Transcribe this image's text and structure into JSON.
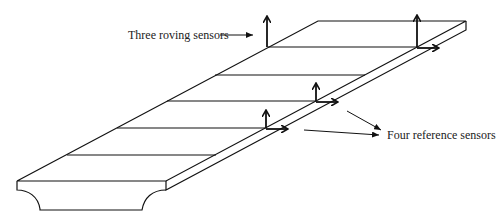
{
  "diagram": {
    "type": "bridge-deck-sensor-layout",
    "labels": {
      "roving": "Three roving sensors",
      "reference": "Four reference sensors"
    },
    "deck": {
      "front_left": [
        17,
        181
      ],
      "front_right": [
        166,
        181
      ],
      "back_left": [
        318,
        21
      ],
      "back_right": [
        466,
        21
      ],
      "cross_lines_y": [
        47,
        75,
        101,
        128,
        155
      ]
    },
    "sensors": [
      {
        "x": 267,
        "y": 47,
        "vertical": true,
        "horizontal": false
      },
      {
        "x": 417,
        "y": 47,
        "vertical": true,
        "horizontal": true
      },
      {
        "x": 316,
        "y": 101,
        "vertical": true,
        "horizontal": true
      },
      {
        "x": 266,
        "y": 128,
        "vertical": true,
        "horizontal": true
      }
    ],
    "colors": {
      "stroke": "#111111",
      "background": "#ffffff"
    }
  }
}
